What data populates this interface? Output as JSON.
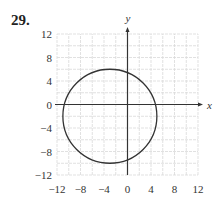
{
  "problem": {
    "number": "29."
  },
  "chart_data": {
    "type": "line",
    "title": "",
    "xlabel": "x",
    "ylabel": "y",
    "xlim": [
      -12,
      12
    ],
    "ylim": [
      -12,
      12
    ],
    "grid": true,
    "grid_step": 2,
    "x_ticks": [
      -12,
      -8,
      -4,
      0,
      4,
      8,
      12
    ],
    "y_ticks": [
      12,
      8,
      4,
      0,
      -4,
      -8,
      -12
    ],
    "x_tick_labels": [
      "−12",
      "−8",
      "−4",
      "0",
      "4",
      "8",
      "12"
    ],
    "y_tick_labels": [
      "12",
      "8",
      "4",
      "0",
      "−4",
      "−8",
      "−12"
    ],
    "series": [
      {
        "name": "circle",
        "shape": "circle",
        "center": [
          -3,
          -2
        ],
        "radius": 8,
        "color": "#333333"
      }
    ],
    "colors": {
      "grid": "#d9d9d9",
      "axis": "#333333",
      "curve": "#333333"
    }
  }
}
